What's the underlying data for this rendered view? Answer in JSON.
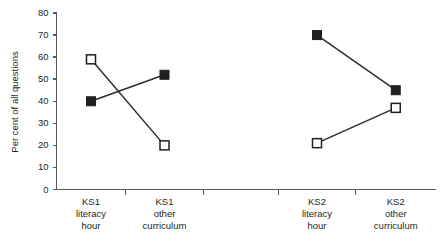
{
  "chart_data": {
    "type": "line",
    "title": "",
    "subtitle": "",
    "xlabel": "",
    "ylabel": "Per cent of all questions",
    "ylim": [
      0,
      80
    ],
    "ytick_labels": [
      "0",
      "10",
      "20",
      "30",
      "40",
      "50",
      "60",
      "70",
      "80"
    ],
    "ytick_values": [
      0,
      10,
      20,
      30,
      40,
      50,
      60,
      70,
      80
    ],
    "grid": false,
    "legend": "none",
    "categories": [
      "KS1 literacy hour",
      "KS1 other curriculum",
      "KS2 literacy hour",
      "KS2 other curriculum"
    ],
    "category_lines": [
      [
        "KS1",
        "literacy",
        "hour"
      ],
      [
        "KS1",
        "other",
        "curriculum"
      ],
      [
        "KS2",
        "literacy",
        "hour"
      ],
      [
        "KS2",
        "other",
        "curriculum"
      ]
    ],
    "series": [
      {
        "name": "filled-square-series",
        "marker": "filled-square",
        "values": [
          40,
          52,
          70,
          45
        ],
        "segments": [
          [
            0,
            1
          ],
          [
            2,
            3
          ]
        ]
      },
      {
        "name": "open-square-series",
        "marker": "open-square",
        "values": [
          59,
          20,
          21,
          37
        ],
        "segments": [
          [
            0,
            1
          ],
          [
            2,
            3
          ]
        ]
      }
    ],
    "colors": {
      "marker_fill": "#231f20",
      "marker_open_fill": "#ffffff",
      "line": "#2f2c2d",
      "axis": "#58595b",
      "background": "#ffffff"
    }
  }
}
